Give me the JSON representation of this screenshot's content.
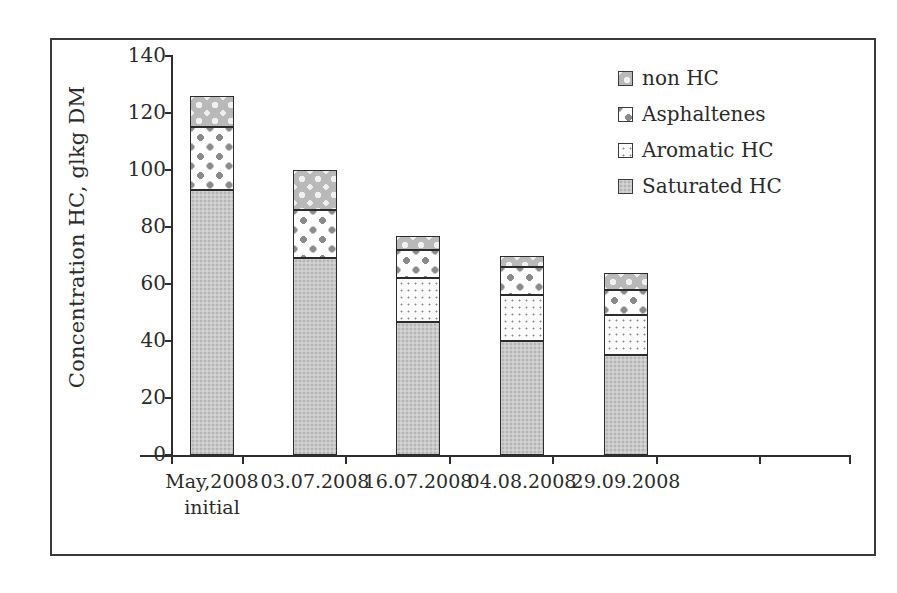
{
  "chart_data": {
    "type": "bar",
    "subtype": "stacked-vertical",
    "title": "",
    "xlabel": "",
    "ylabel": "Concentration HC, glkg DM",
    "ylim": [
      0,
      140
    ],
    "ytick_values": [
      0,
      20,
      40,
      60,
      80,
      100,
      120,
      140
    ],
    "ytick_labels": [
      "0",
      "20",
      "40",
      "60",
      "80",
      "100",
      "120",
      "140"
    ],
    "grid": false,
    "legend_position": "upper-right",
    "categories": [
      "May,2008 initial",
      "03.07.2008",
      "16.07.2008",
      "04.08.2008",
      "29.09.2008"
    ],
    "category_lines": [
      [
        "May,2008",
        "initial"
      ],
      [
        "03.07.2008",
        ""
      ],
      [
        "16.07.2008",
        ""
      ],
      [
        "04.08.2008",
        ""
      ],
      [
        "29.09.2008",
        ""
      ]
    ],
    "series": [
      {
        "name": "Saturated HC",
        "values": [
          93,
          69,
          46.5,
          40,
          35
        ]
      },
      {
        "name": "Aromatic HC",
        "values": [
          0,
          0,
          15.5,
          16,
          14
        ]
      },
      {
        "name": "Asphaltenes",
        "values": [
          22,
          17,
          10,
          10,
          9
        ]
      },
      {
        "name": "non HC",
        "values": [
          11,
          14,
          5,
          4,
          6
        ]
      }
    ],
    "totals": [
      126,
      100,
      77,
      70,
      64
    ],
    "legend_order_top_down": [
      "non HC",
      "Asphaltenes",
      "Aromatic HC",
      "Saturated HC"
    ]
  },
  "legend": {
    "items": [
      {
        "label": "non HC",
        "swatch": "non-hc-pattern"
      },
      {
        "label": "Asphaltenes",
        "swatch": "asphaltenes-pattern"
      },
      {
        "label": "Aromatic HC",
        "swatch": "aromatic-hc-pattern"
      },
      {
        "label": "Saturated HC",
        "swatch": "saturated-hc-pattern"
      }
    ]
  },
  "colors": {
    "saturated": "#c9c9c9",
    "aromatic": "#fbfbfb",
    "asphaltenes": "#fdfdfd",
    "non_hc": "#b9b9b9",
    "axis": "#2e2e2e",
    "text": "#2b2b2b",
    "frame": "#3a3a3a",
    "background": "#ffffff"
  }
}
